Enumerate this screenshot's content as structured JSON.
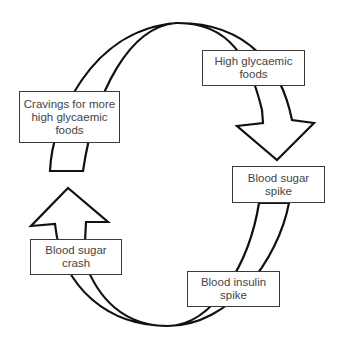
{
  "diagram": {
    "type": "cycle",
    "stroke_color": "#111111",
    "box_border_color": "#3a3a3a",
    "text_color": "#444444",
    "nodes": [
      {
        "id": "high-glycaemic-foods",
        "label": "High glycaemic foods"
      },
      {
        "id": "blood-sugar-spike",
        "label": "Blood sugar spike"
      },
      {
        "id": "blood-insulin-spike",
        "label": "Blood insulin spike"
      },
      {
        "id": "blood-sugar-crash",
        "label": "Blood sugar crash"
      },
      {
        "id": "cravings",
        "label": "Cravings for more high glycaemic foods"
      }
    ],
    "edges": [
      {
        "from": "cravings",
        "to": "high-glycaemic-foods"
      },
      {
        "from": "high-glycaemic-foods",
        "to": "blood-sugar-spike"
      },
      {
        "from": "blood-sugar-spike",
        "to": "blood-insulin-spike"
      },
      {
        "from": "blood-insulin-spike",
        "to": "blood-sugar-crash"
      },
      {
        "from": "blood-sugar-crash",
        "to": "cravings"
      }
    ]
  }
}
